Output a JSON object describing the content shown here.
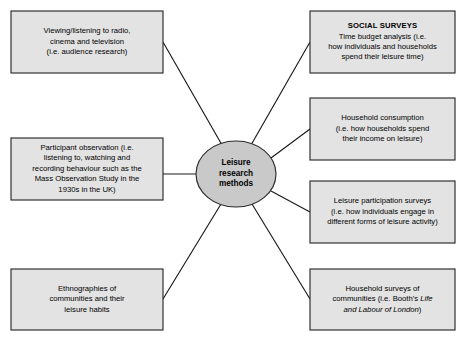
{
  "diagram": {
    "type": "spider-web-mind-map",
    "center": {
      "label_lines": [
        "Leisure",
        "research",
        "methods"
      ],
      "text": "Leisure research methods"
    },
    "colors": {
      "box_fill": "#e3e3e3",
      "center_fill": "#c9c9c9",
      "stroke": "#2b2b2b",
      "connector": "#1a1a1a",
      "text": "#000000",
      "background": "#ffffff"
    },
    "nodes": [
      {
        "id": "viewing-listening",
        "position": "top-left",
        "heading": "",
        "lines": [
          "Viewing/listening to radio,",
          "cinema and television",
          "(i.e. audience research)"
        ],
        "text": "Viewing/listening to radio, cinema and television (i.e. audience research)"
      },
      {
        "id": "participant-observation",
        "position": "middle-left",
        "heading": "",
        "lines": [
          "Participant observation (i.e.",
          "listening to, watching and",
          "recording behaviour such as the",
          "Mass Observation Study in the",
          "1930s in the UK)"
        ],
        "text": "Participant observation (i.e. listening to, watching and recording behaviour such as the Mass Observation Study in the 1930s in the UK)"
      },
      {
        "id": "ethnographies",
        "position": "bottom-left",
        "heading": "",
        "lines": [
          "Ethnographies of",
          "communities and their",
          "leisure habits"
        ],
        "text": "Ethnographies of communities and their leisure habits"
      },
      {
        "id": "social-surveys",
        "position": "top-right",
        "heading": "SOCIAL SURVEYS",
        "lines": [
          "Time budget analysis (i.e.",
          "how individuals and households",
          "spend their leisure time)"
        ],
        "text": "SOCIAL SURVEYS Time budget analysis (i.e. how individuals and households spend their leisure time)"
      },
      {
        "id": "household-consumption",
        "position": "upper-middle-right",
        "heading": "",
        "lines": [
          "Household consumption",
          "(i.e. how households spend",
          "their income on leisure)"
        ],
        "text": "Household consumption (i.e. how households spend their income on leisure)"
      },
      {
        "id": "leisure-participation",
        "position": "lower-middle-right",
        "heading": "",
        "lines": [
          "Leisure participation surveys",
          "(i.e. how individuals engage in",
          "different forms of leisure activity)"
        ],
        "text": "Leisure participation surveys (i.e. how individuals engage in different forms of leisure activity)"
      },
      {
        "id": "household-surveys",
        "position": "bottom-right",
        "heading": "",
        "lines": [
          "Household surveys of",
          "communities (i.e. Booth's Life",
          "and Labour of London)"
        ],
        "italic_title": "Life and Labour of London",
        "text": "Household surveys of communities (i.e. Booth's Life and Labour of London)"
      }
    ]
  }
}
